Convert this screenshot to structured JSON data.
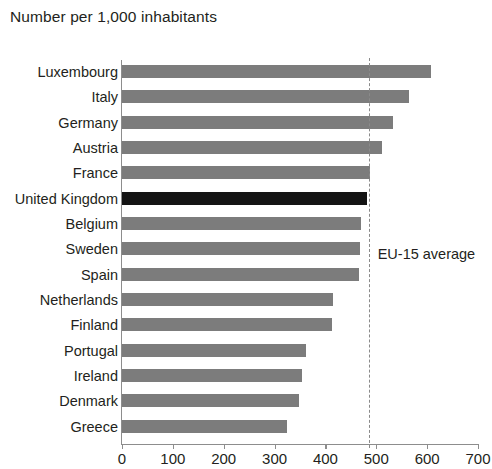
{
  "chart_data": {
    "type": "bar",
    "orientation": "horizontal",
    "title": "Number per 1,000 inhabitants",
    "xlabel": "",
    "ylabel": "",
    "xlim": [
      0,
      700
    ],
    "xticks": [
      0,
      100,
      200,
      300,
      400,
      500,
      600,
      700
    ],
    "grid": false,
    "legend": "none",
    "categories": [
      "Luxembourg",
      "Italy",
      "Germany",
      "Austria",
      "France",
      "United Kingdom",
      "Belgium",
      "Sweden",
      "Spain",
      "Netherlands",
      "Finland",
      "Portugal",
      "Ireland",
      "Denmark",
      "Greece"
    ],
    "values": [
      608,
      565,
      532,
      512,
      487,
      481,
      470,
      468,
      466,
      415,
      412,
      361,
      354,
      348,
      324
    ],
    "highlight_category": "United Kingdom",
    "annotations": [
      {
        "name": "EU-15 average",
        "label": "EU-15 average",
        "value": 485,
        "style": "dashed-vertical-line"
      }
    ],
    "colors": {
      "bar": "#7c7c7c",
      "bar_highlight": "#141414",
      "axis": "#8d8d8d",
      "text": "#231f20",
      "average_line": "#8a8a8a",
      "background": "#ffffff"
    }
  }
}
